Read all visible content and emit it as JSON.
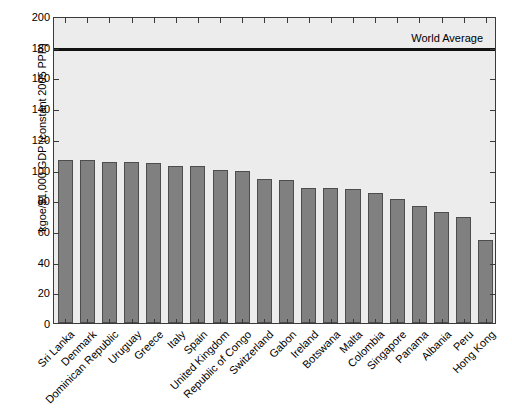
{
  "chart_data": {
    "type": "bar",
    "title": "",
    "subtitle": "",
    "xlabel": "",
    "ylabel": "kgoe/$1,000 GDP (constant 2005 PPP)",
    "ylim": [
      0,
      200
    ],
    "yticks": [
      0,
      20,
      40,
      60,
      80,
      100,
      120,
      140,
      160,
      180,
      200
    ],
    "grid": false,
    "legend": "none",
    "bar_color": "#808080",
    "bar_edge_color": "#4d4d4d",
    "plot_background": "#ececec",
    "axis_color": "#3a3a3a",
    "categories": [
      "Sri Lanka",
      "Denmark",
      "Dominican Republic",
      "Uruguay",
      "Greece",
      "Italy",
      "Spain",
      "United Kingdom",
      "Republic of Congo",
      "Switzerland",
      "Gabon",
      "Ireland",
      "Botswana",
      "Malta",
      "Colombia",
      "Singapore",
      "Panama",
      "Albania",
      "Peru",
      "Hong Kong"
    ],
    "values": [
      106,
      106,
      105,
      105,
      104,
      102,
      102,
      100,
      99,
      94,
      93,
      88,
      88,
      87,
      85,
      81,
      76,
      72,
      69,
      54
    ],
    "annotations": [
      {
        "name": "world-average-line",
        "label": "World Average",
        "value": 180,
        "orientation": "horizontal",
        "color": "#111111",
        "label_position": "top-right"
      }
    ]
  }
}
